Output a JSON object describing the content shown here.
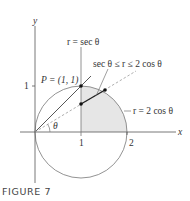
{
  "figure": {
    "caption": "FIGURE 7",
    "axes": {
      "x_label": "x",
      "y_label": "y",
      "x_ticks": [
        "1",
        "2"
      ],
      "y_ticks": [
        "1"
      ]
    },
    "labels": {
      "line_label": "r = sec θ",
      "region_label": "sec θ ≤ r ≤ 2 cos θ",
      "circle_label": "r = 2 cos θ",
      "point_label": "P = (1, 1)",
      "angle_label": "θ"
    },
    "colors": {
      "shade": "#e6e6e6",
      "stroke": "#555555",
      "dashed": "#9a9a9a"
    }
  }
}
